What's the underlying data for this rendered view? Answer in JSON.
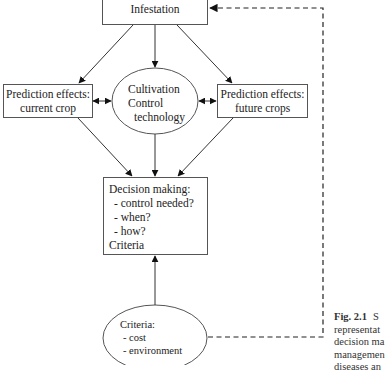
{
  "diagram": {
    "nodes": {
      "infestation": {
        "label": "Infestation",
        "shape": "rectangle"
      },
      "prediction_current": {
        "line1": "Prediction effects:",
        "line2": "current crop",
        "shape": "rectangle"
      },
      "cultivation": {
        "line1": "Cultivation",
        "line2": "Control",
        "line3": "technology",
        "shape": "ellipse"
      },
      "prediction_future": {
        "line1": "Prediction effects:",
        "line2": "future crops",
        "shape": "rectangle"
      },
      "decision": {
        "title": "Decision making:",
        "items": [
          "- control needed?",
          "- when?",
          "- how?"
        ],
        "footer": "Criteria",
        "shape": "rectangle"
      },
      "criteria": {
        "title": "Criteria:",
        "items": [
          "- cost",
          "- environment"
        ],
        "shape": "ellipse"
      }
    },
    "edges": [
      {
        "from": "infestation",
        "to": "prediction_current",
        "style": "solid"
      },
      {
        "from": "infestation",
        "to": "cultivation",
        "style": "solid"
      },
      {
        "from": "infestation",
        "to": "prediction_future",
        "style": "solid"
      },
      {
        "from": "prediction_current",
        "to": "cultivation",
        "style": "solid",
        "bidirectional": true
      },
      {
        "from": "cultivation",
        "to": "prediction_future",
        "style": "solid",
        "bidirectional": true
      },
      {
        "from": "prediction_current",
        "to": "decision",
        "style": "solid"
      },
      {
        "from": "cultivation",
        "to": "decision",
        "style": "solid"
      },
      {
        "from": "prediction_future",
        "to": "decision",
        "style": "solid"
      },
      {
        "from": "criteria",
        "to": "decision",
        "style": "solid"
      },
      {
        "from": "criteria",
        "to": "infestation",
        "style": "dashed"
      }
    ]
  },
  "caption": {
    "fig_num": "Fig. 2.1",
    "lines": [
      "S",
      "representat",
      "decision ma",
      "managemen",
      "diseases an"
    ]
  }
}
